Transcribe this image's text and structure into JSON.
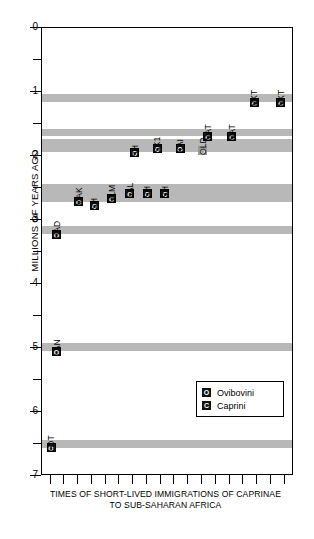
{
  "chart_data": {
    "type": "scatter",
    "title": "",
    "caption_line1": "TIMES OF SHORT-LIVED IMMIGRATIONS OF CAPRINAE",
    "caption_line2": "TO SUB-SAHARAN AFRICA",
    "ylabel": "MILLIONS OF YEARS AGO",
    "xlabel": "",
    "ylim": [
      0,
      7
    ],
    "y_axis_inverted": false,
    "grid": false,
    "y_major_ticks": [
      "0",
      "1",
      "2",
      "3",
      "4",
      "5",
      "6",
      "7"
    ],
    "y_minor_ticks": [
      0.5,
      1.5,
      2.5,
      3.5,
      4.5,
      5.5,
      6.5
    ],
    "x_tick_count": 18,
    "legend": {
      "position": "lower-right",
      "entries": [
        {
          "symbol": "O",
          "label": "Ovibovini"
        },
        {
          "symbol": "C",
          "label": "Caprini"
        }
      ]
    },
    "bands": [
      {
        "name": "band-1.1",
        "top": 1.03,
        "bottom": 1.15
      },
      {
        "name": "band-1.62",
        "top": 1.58,
        "bottom": 1.68
      },
      {
        "name": "band-1.82",
        "top": 1.74,
        "bottom": 1.93
      },
      {
        "name": "band-2.6",
        "top": 2.43,
        "bottom": 2.72
      },
      {
        "name": "band-3.15",
        "top": 3.1,
        "bottom": 3.22
      },
      {
        "name": "band-5.0",
        "top": 4.92,
        "bottom": 5.05
      },
      {
        "name": "band-6.5",
        "top": 6.44,
        "bottom": 6.56
      }
    ],
    "points": [
      {
        "label": "NKT",
        "symbol": "C",
        "group": "Caprini",
        "x": 0.825,
        "y": 1.09,
        "faint": false
      },
      {
        "label": "NKT",
        "symbol": "C",
        "group": "Caprini",
        "x": 0.93,
        "y": 1.09,
        "faint": false
      },
      {
        "label": "NAT",
        "symbol": "C",
        "group": "Caprini",
        "x": 0.64,
        "y": 1.63,
        "faint": false
      },
      {
        "label": "NAT",
        "symbol": "C",
        "group": "Caprini",
        "x": 0.735,
        "y": 1.63,
        "faint": false
      },
      {
        "label": "SH",
        "symbol": "O",
        "group": "Ovibovini",
        "x": 0.35,
        "y": 1.88,
        "faint": false
      },
      {
        "label": "SK1",
        "symbol": "O",
        "group": "Ovibovini",
        "x": 0.44,
        "y": 1.82,
        "faint": false
      },
      {
        "label": "KAI",
        "symbol": "O",
        "group": "Ovibovini",
        "x": 0.53,
        "y": 1.82,
        "faint": false
      },
      {
        "label": "OLD",
        "symbol": "O",
        "group": "Ovibovini",
        "x": 0.62,
        "y": 1.84,
        "faint": true
      },
      {
        "label": "MAK",
        "symbol": "O",
        "group": "Ovibovini",
        "x": 0.128,
        "y": 2.64,
        "faint": false
      },
      {
        "label": "SH",
        "symbol": "O",
        "group": "Ovibovini",
        "x": 0.19,
        "y": 2.7,
        "faint": false
      },
      {
        "label": "ULM",
        "symbol": "C",
        "group": "Caprini",
        "x": 0.258,
        "y": 2.59,
        "faint": false
      },
      {
        "label": "LAL",
        "symbol": "C",
        "group": "Caprini",
        "x": 0.33,
        "y": 2.51,
        "faint": false
      },
      {
        "label": "SH",
        "symbol": "O",
        "group": "Ovibovini",
        "x": 0.4,
        "y": 2.51,
        "faint": false
      },
      {
        "label": "SH",
        "symbol": "C",
        "group": "Caprini",
        "x": 0.47,
        "y": 2.51,
        "faint": false
      },
      {
        "label": "HAD",
        "symbol": "O",
        "group": "Ovibovini",
        "x": 0.04,
        "y": 3.16,
        "faint": false
      },
      {
        "label": "LAN",
        "symbol": "O",
        "group": "Ovibovini",
        "x": 0.04,
        "y": 4.98,
        "faint": false
      },
      {
        "label": "LOT",
        "symbol": "O",
        "group": "Ovibovini",
        "x": 0.018,
        "y": 6.49,
        "faint": false
      }
    ]
  }
}
